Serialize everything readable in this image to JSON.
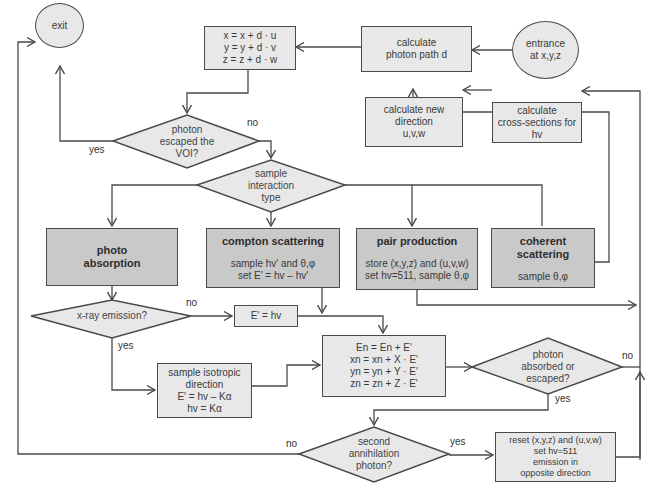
{
  "colors": {
    "line": "#4a4a4a",
    "box_light": "#e8e8e8",
    "box_dark": "#c9c9c9",
    "text": "#3a3a3a",
    "background": "#ffffff"
  },
  "nodes": {
    "exit": {
      "label": "exit"
    },
    "entrance": {
      "lines": [
        "entrance",
        "at x,y,z"
      ]
    },
    "calc_path": {
      "lines": [
        "calculate",
        "photon path d"
      ]
    },
    "update_pos": {
      "lines": [
        "x = x + d · u",
        "y = y + d · v",
        "z = z + d · w"
      ]
    },
    "calc_direction": {
      "lines": [
        "calculate new",
        "direction",
        "u,v,w"
      ]
    },
    "calc_cross": {
      "lines": [
        "calculate",
        "cross-sections for",
        "hv"
      ]
    },
    "escaped_voi": {
      "lines": [
        "photon",
        "escaped the",
        "VOI?"
      ]
    },
    "sample_type": {
      "lines": [
        "sample",
        "interaction",
        "type"
      ]
    },
    "photo_absorption": {
      "title_lines": [
        "photo",
        "absorption"
      ]
    },
    "compton": {
      "title": "compton scattering",
      "lines": [
        "sample hv' and θ,φ",
        "set E' = hv – hv'"
      ]
    },
    "pair_production": {
      "title": "pair production",
      "lines": [
        "store (x,y,z) and (u,v,w)",
        "set hv=511, sample θ,φ"
      ]
    },
    "coherent": {
      "title": "coherent scattering",
      "lines": [
        "sample θ,φ"
      ]
    },
    "xray_emission": {
      "label": "x-ray emission?"
    },
    "e_equals_hv": {
      "label": "E' = hv"
    },
    "isotropic": {
      "lines": [
        "sample isotropic",
        "direction",
        "E' = hv – Kα",
        "hv = Kα"
      ]
    },
    "energy_update": {
      "lines": [
        "En = En + E'",
        "xn = xn + X · E'",
        "yn = yn + Y · E'",
        "zn = zn + Z · E'"
      ]
    },
    "absorbed_escaped": {
      "lines": [
        "photon",
        "absorbed or",
        "escaped?"
      ]
    },
    "second_annihilation": {
      "lines": [
        "second",
        "annihilation",
        "photon?"
      ]
    },
    "reset": {
      "lines": [
        "reset (x,y,z) and (u,v,w)",
        "set hv=511",
        "emission in",
        "opposite direction"
      ]
    }
  },
  "edge_labels": {
    "voi_yes": "yes",
    "voi_no": "no",
    "xray_no": "no",
    "xray_yes": "yes",
    "absorbed_no": "no",
    "absorbed_yes": "yes",
    "annihilation_no": "no",
    "annihilation_yes": "yes"
  }
}
